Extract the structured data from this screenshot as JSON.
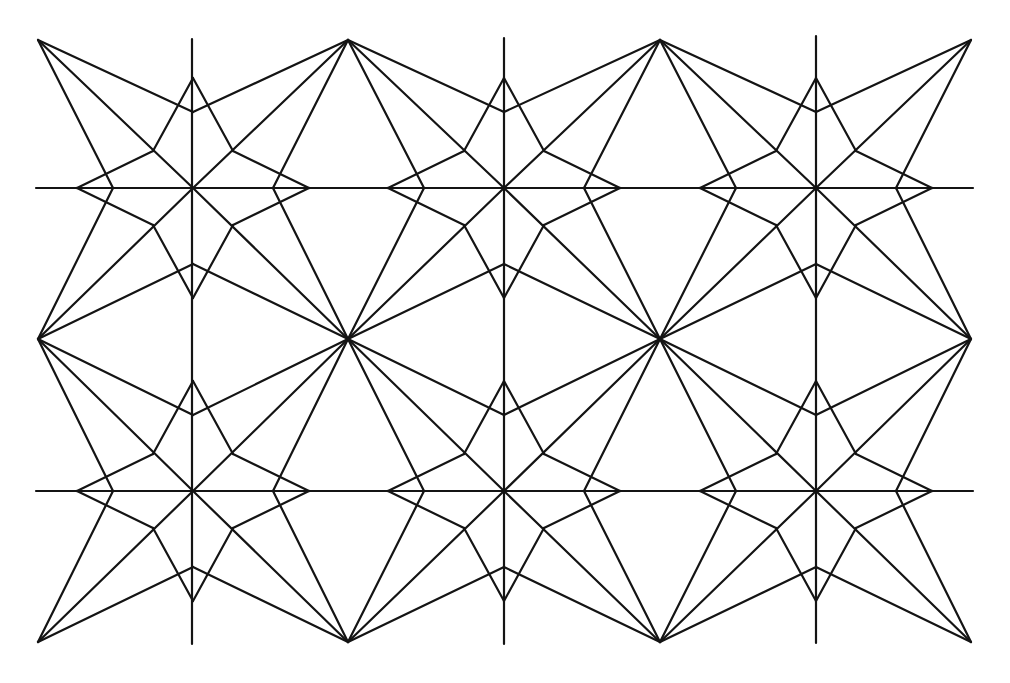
{
  "figure": {
    "kind": "geometric star tessellation",
    "background": "#ffffff",
    "stroke_color": "#141414",
    "stroke_width": 2.2
  },
  "grid": {
    "columns_x": [
      38,
      348,
      660,
      971
    ],
    "rows_y": [
      40,
      339,
      642
    ],
    "star_centers_x": [
      193,
      504,
      816
    ],
    "star_centers_y": [
      188,
      491
    ],
    "axis_lines": {
      "vertical": [
        {
          "x": 192,
          "y1": 39,
          "y2": 644
        },
        {
          "x": 504,
          "y1": 38,
          "y2": 644
        },
        {
          "x": 816,
          "y1": 36,
          "y2": 643
        }
      ],
      "horizontal": [
        {
          "y": 188,
          "x1": 36,
          "x2": 973
        },
        {
          "y": 491,
          "x1": 36,
          "x2": 973
        }
      ]
    }
  },
  "star_geometry": {
    "tip_v": 110,
    "notch_v": 76,
    "tip_h": 116,
    "notch_h": 80,
    "inner_dx": 40,
    "inner_dy": 37
  }
}
